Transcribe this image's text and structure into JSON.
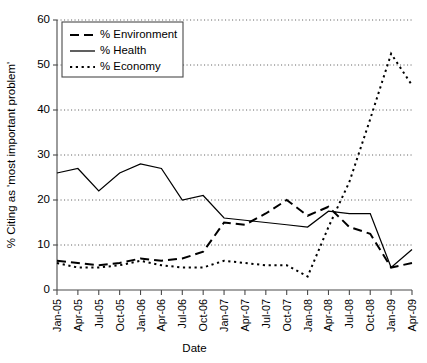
{
  "chart_data": {
    "type": "line",
    "title": "",
    "xlabel": "Date",
    "ylabel": "% Citing as 'most important problem'",
    "ylim": [
      0,
      60
    ],
    "ytick_labels": [
      "0",
      "10",
      "20",
      "30",
      "40",
      "50",
      "60"
    ],
    "yticks": [
      0,
      10,
      20,
      30,
      40,
      50,
      60
    ],
    "grid": true,
    "grid_axis": "y",
    "legend_position": "upper-left",
    "categories": [
      "Jan-05",
      "Apr-05",
      "Jul-05",
      "Oct-05",
      "Jan-06",
      "Apr-06",
      "Jul-06",
      "Oct-06",
      "Jan-07",
      "Apr-07",
      "Jul-07",
      "Oct-07",
      "Jan-08",
      "Apr-08",
      "Jul-08",
      "Oct-08",
      "Jan-09",
      "Apr-09"
    ],
    "series": [
      {
        "name": "% Environment",
        "style": "dashed",
        "values": [
          6.5,
          6.0,
          5.5,
          6.0,
          7.0,
          6.5,
          7.0,
          8.5,
          15.0,
          14.5,
          17.0,
          20.0,
          16.5,
          18.5,
          14.0,
          12.5,
          5.0,
          6.0
        ]
      },
      {
        "name": "% Health",
        "style": "solid",
        "values": [
          26.0,
          27.0,
          22.0,
          26.0,
          28.0,
          27.0,
          20.0,
          21.0,
          16.0,
          15.5,
          15.0,
          14.5,
          14.0,
          17.5,
          17.0,
          17.0,
          5.0,
          9.0
        ]
      },
      {
        "name": "% Economy",
        "style": "dotted",
        "values": [
          6.0,
          5.0,
          5.0,
          5.5,
          6.5,
          5.5,
          5.0,
          5.0,
          6.5,
          6.0,
          5.5,
          5.5,
          3.0,
          14.0,
          24.0,
          38.0,
          52.5,
          45.5
        ]
      }
    ]
  },
  "legend": {
    "items": [
      {
        "label": "% Environment",
        "style": "dashed"
      },
      {
        "label": "% Health",
        "style": "solid"
      },
      {
        "label": "% Economy",
        "style": "dotted"
      }
    ]
  }
}
